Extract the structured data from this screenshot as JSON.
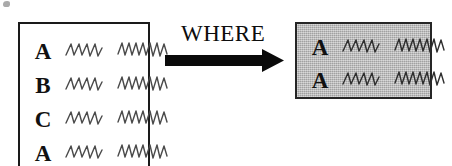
{
  "diagram": {
    "operator_label": "WHERE",
    "arrow_icon": "right-arrow-icon",
    "colors": {
      "ink": "#111111",
      "border": "#1a1a1a",
      "result_fill": "#b4b4b4",
      "squiggle": "#4a4a4a",
      "page_background": "#ffffff"
    },
    "source_table": {
      "name": "input-table",
      "filled": false,
      "rows": [
        {
          "key": "A",
          "cell_short": "squiggle-short-icon",
          "cell_long": "squiggle-long-icon"
        },
        {
          "key": "B",
          "cell_short": "squiggle-short-icon",
          "cell_long": "squiggle-long-icon"
        },
        {
          "key": "C",
          "cell_short": "squiggle-short-icon",
          "cell_long": "squiggle-long-icon"
        },
        {
          "key": "A",
          "cell_short": "squiggle-short-icon",
          "cell_long": "squiggle-long-icon"
        }
      ]
    },
    "result_table": {
      "name": "output-table",
      "filled": true,
      "rows": [
        {
          "key": "A",
          "cell_short": "squiggle-short-icon",
          "cell_long": "squiggle-long-icon"
        },
        {
          "key": "A",
          "cell_short": "squiggle-short-icon",
          "cell_long": "squiggle-long-icon"
        }
      ]
    }
  }
}
